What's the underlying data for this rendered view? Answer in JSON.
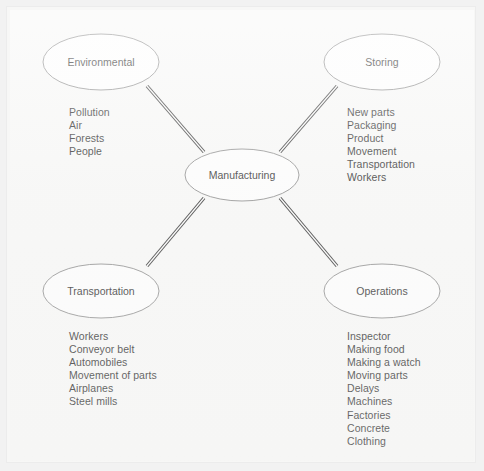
{
  "page": {
    "background_color": "#f2f2f2",
    "paper_color": "#f7f7f6",
    "frame_color": "#ececec"
  },
  "style": {
    "ellipse_fill": "#fdfdfd",
    "ellipse_stroke": "#8a8a8a",
    "connector_color": "#2a2a2a",
    "text_color": "#1c1c1c"
  },
  "center_node": {
    "label": "Manufacturing",
    "cx": 242,
    "cy": 175,
    "rx": 57,
    "ry": 26
  },
  "branches": [
    {
      "id": "environmental",
      "label": "Environmental",
      "cx": 101,
      "cy": 62,
      "rx": 58,
      "ry": 28,
      "items": [
        "Pollution",
        "Air",
        "Forests",
        "People"
      ]
    },
    {
      "id": "storing",
      "label": "Storing",
      "cx": 382,
      "cy": 62,
      "rx": 58,
      "ry": 28,
      "items": [
        "New parts",
        "Packaging",
        "Product",
        "Movement",
        "Transportation",
        "Workers"
      ]
    },
    {
      "id": "transportation",
      "label": "Transportation",
      "cx": 101,
      "cy": 291,
      "rx": 58,
      "ry": 27,
      "items": [
        "Workers",
        "Conveyor belt",
        "Automobiles",
        "Movement of parts",
        "Airplanes",
        "Steel mills"
      ]
    },
    {
      "id": "operations",
      "label": "Operations",
      "cx": 382,
      "cy": 291,
      "rx": 58,
      "ry": 27,
      "items": [
        "Inspector",
        "Making food",
        "Making a watch",
        "Moving parts",
        "Delays",
        "Machines",
        "Factories",
        "Concrete",
        "Clothing"
      ]
    }
  ],
  "connectors": [
    {
      "id": "center-to-environmental",
      "x1": 204,
      "y1": 152,
      "x2": 147,
      "y2": 86
    },
    {
      "id": "center-to-storing",
      "x1": 280,
      "y1": 152,
      "x2": 337,
      "y2": 86
    },
    {
      "id": "center-to-transportation",
      "x1": 204,
      "y1": 198,
      "x2": 147,
      "y2": 266
    },
    {
      "id": "center-to-operations",
      "x1": 280,
      "y1": 198,
      "x2": 337,
      "y2": 266
    }
  ]
}
